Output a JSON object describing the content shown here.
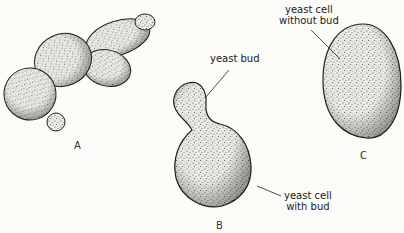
{
  "figure": {
    "panels": [
      {
        "id": "A",
        "letter": "A"
      },
      {
        "id": "B",
        "letter": "B"
      },
      {
        "id": "C",
        "letter": "C"
      }
    ],
    "annotations": {
      "yeast_bud": "yeast bud",
      "cell_with_bud_line1": "yeast cell",
      "cell_with_bud_line2": "with bud",
      "cell_without_bud_line1": "yeast cell",
      "cell_without_bud_line2": "without bud"
    },
    "colors": {
      "background": "#fbfbf8",
      "outline": "#222222",
      "stipple": "#555555"
    }
  }
}
